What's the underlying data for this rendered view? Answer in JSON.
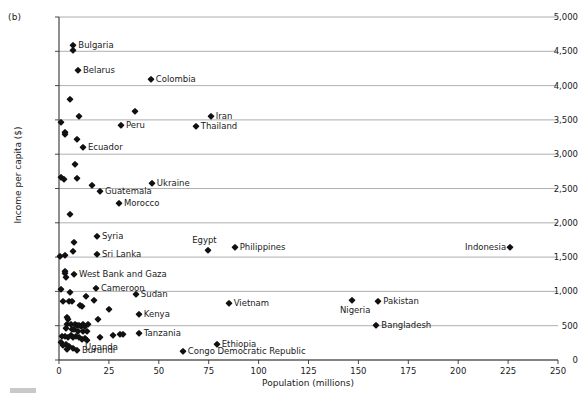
{
  "figure": {
    "panel_tag": "(b)",
    "caption_bar_color": "#c9c9c9"
  },
  "chart_data": {
    "type": "scatter",
    "title": "",
    "subtitle": "",
    "xlabel": "Population (millions)",
    "ylabel": "Income per capita ($)",
    "xlim": [
      0,
      250
    ],
    "ylim": [
      0,
      5000
    ],
    "xticks": [
      0,
      25,
      50,
      75,
      100,
      125,
      150,
      175,
      200,
      225,
      250
    ],
    "xtick_labels": [
      "0",
      "25",
      "50",
      "75",
      "100",
      "125",
      "150",
      "175",
      "200",
      "225",
      "250"
    ],
    "yticks": [
      0,
      500,
      1000,
      1500,
      2000,
      2500,
      3000,
      3500,
      4000,
      4500,
      5000
    ],
    "ytick_labels": [
      "0",
      "500",
      "1,000",
      "1,500",
      "2,000",
      "2,500",
      "3,000",
      "3,500",
      "4,000",
      "4,500",
      "5,000"
    ],
    "grid": "horizontal",
    "grid_color": "#9a9a9a",
    "axis_color": "#333333",
    "marker_color": "#111111",
    "marker_shape": "diamond",
    "legend": "none",
    "points": [
      {
        "label": "Bulgaria",
        "x": 7.2,
        "y": 4590,
        "label_pos": "right"
      },
      {
        "label": "",
        "x": 7.0,
        "y": 4520,
        "label_pos": "right"
      },
      {
        "label": "Belarus",
        "x": 9.5,
        "y": 4230,
        "label_pos": "right"
      },
      {
        "label": "Colombia",
        "x": 46.0,
        "y": 4090,
        "label_pos": "right"
      },
      {
        "label": "",
        "x": 5.5,
        "y": 3800,
        "label_pos": "right"
      },
      {
        "label": "",
        "x": 38.0,
        "y": 3625,
        "label_pos": "right"
      },
      {
        "label": "Iran",
        "x": 76.0,
        "y": 3550,
        "label_pos": "right"
      },
      {
        "label": "",
        "x": 10.0,
        "y": 3560,
        "label_pos": "right"
      },
      {
        "label": "",
        "x": 1.2,
        "y": 3470,
        "label_pos": "right"
      },
      {
        "label": "Peru",
        "x": 31.0,
        "y": 3420,
        "label_pos": "right"
      },
      {
        "label": "Thailand",
        "x": 68.5,
        "y": 3405,
        "label_pos": "right"
      },
      {
        "label": "",
        "x": 3.0,
        "y": 3325,
        "label_pos": "right"
      },
      {
        "label": "",
        "x": 2.8,
        "y": 3290,
        "label_pos": "right"
      },
      {
        "label": "",
        "x": 8.8,
        "y": 3215,
        "label_pos": "right"
      },
      {
        "label": "Ecuador",
        "x": 12.0,
        "y": 3110,
        "label_pos": "right"
      },
      {
        "label": "",
        "x": 7.8,
        "y": 2855,
        "label_pos": "right"
      },
      {
        "label": "",
        "x": 0.8,
        "y": 2665,
        "label_pos": "right"
      },
      {
        "label": "",
        "x": 2.4,
        "y": 2640,
        "label_pos": "right"
      },
      {
        "label": "",
        "x": 9.0,
        "y": 2650,
        "label_pos": "right"
      },
      {
        "label": "Ukraine",
        "x": 46.5,
        "y": 2575,
        "label_pos": "right"
      },
      {
        "label": "",
        "x": 16.5,
        "y": 2545,
        "label_pos": "right"
      },
      {
        "label": "Guatemala",
        "x": 20.5,
        "y": 2460,
        "label_pos": "right"
      },
      {
        "label": "Morocco",
        "x": 30.0,
        "y": 2295,
        "label_pos": "right"
      },
      {
        "label": "",
        "x": 5.3,
        "y": 2125,
        "label_pos": "right"
      },
      {
        "label": "Syria",
        "x": 19.0,
        "y": 1810,
        "label_pos": "right"
      },
      {
        "label": "",
        "x": 7.3,
        "y": 1725,
        "label_pos": "right"
      },
      {
        "label": "Egypt",
        "x": 74.5,
        "y": 1600,
        "label_pos": "above-left"
      },
      {
        "label": "Philippines",
        "x": 88.0,
        "y": 1650,
        "label_pos": "right"
      },
      {
        "label": "Indonesia",
        "x": 226.0,
        "y": 1650,
        "label_pos": "left"
      },
      {
        "label": "",
        "x": 6.8,
        "y": 1595,
        "label_pos": "right"
      },
      {
        "label": "Sri Lanka",
        "x": 19.0,
        "y": 1550,
        "label_pos": "right"
      },
      {
        "label": "",
        "x": 0.6,
        "y": 1510,
        "label_pos": "right"
      },
      {
        "label": "",
        "x": 3.2,
        "y": 1530,
        "label_pos": "right"
      },
      {
        "label": "",
        "x": 3.0,
        "y": 1300,
        "label_pos": "right"
      },
      {
        "label": "",
        "x": 3.1,
        "y": 1265,
        "label_pos": "right"
      },
      {
        "label": "West Bank and Gaza",
        "x": 7.5,
        "y": 1255,
        "label_pos": "right"
      },
      {
        "label": "",
        "x": 3.3,
        "y": 1215,
        "label_pos": "right"
      },
      {
        "label": "Cameroon",
        "x": 18.5,
        "y": 1055,
        "label_pos": "right"
      },
      {
        "label": "",
        "x": 0.9,
        "y": 1035,
        "label_pos": "right"
      },
      {
        "label": "",
        "x": 5.6,
        "y": 995,
        "label_pos": "right"
      },
      {
        "label": "Sudan",
        "x": 38.5,
        "y": 965,
        "label_pos": "right"
      },
      {
        "label": "",
        "x": 13.5,
        "y": 935,
        "label_pos": "right"
      },
      {
        "label": "",
        "x": 2.0,
        "y": 855,
        "label_pos": "right"
      },
      {
        "label": "",
        "x": 5.0,
        "y": 860,
        "label_pos": "right"
      },
      {
        "label": "",
        "x": 6.4,
        "y": 855,
        "label_pos": "right"
      },
      {
        "label": "",
        "x": 17.5,
        "y": 880,
        "label_pos": "right"
      },
      {
        "label": "Vietnam",
        "x": 85.0,
        "y": 835,
        "label_pos": "right"
      },
      {
        "label": "",
        "x": 10.5,
        "y": 805,
        "label_pos": "right"
      },
      {
        "label": "",
        "x": 11.5,
        "y": 790,
        "label_pos": "right"
      },
      {
        "label": "",
        "x": 25.0,
        "y": 740,
        "label_pos": "right"
      },
      {
        "label": "",
        "x": 4.2,
        "y": 630,
        "label_pos": "right"
      },
      {
        "label": "",
        "x": 4.3,
        "y": 600,
        "label_pos": "right"
      },
      {
        "label": "Kenya",
        "x": 40.0,
        "y": 670,
        "label_pos": "right"
      },
      {
        "label": "",
        "x": 19.5,
        "y": 595,
        "label_pos": "right"
      },
      {
        "label": "Nigeria",
        "x": 147.0,
        "y": 875,
        "label_pos": "below"
      },
      {
        "label": "Pakistan",
        "x": 160.0,
        "y": 855,
        "label_pos": "right"
      },
      {
        "label": "Bangladesh",
        "x": 159.0,
        "y": 505,
        "label_pos": "right"
      },
      {
        "label": "",
        "x": 4.0,
        "y": 530,
        "label_pos": "right"
      },
      {
        "label": "",
        "x": 5.8,
        "y": 520,
        "label_pos": "right"
      },
      {
        "label": "",
        "x": 8.2,
        "y": 530,
        "label_pos": "right"
      },
      {
        "label": "",
        "x": 9.0,
        "y": 505,
        "label_pos": "right"
      },
      {
        "label": "",
        "x": 10.0,
        "y": 515,
        "label_pos": "right"
      },
      {
        "label": "",
        "x": 11.0,
        "y": 500,
        "label_pos": "right"
      },
      {
        "label": "",
        "x": 12.0,
        "y": 520,
        "label_pos": "right"
      },
      {
        "label": "",
        "x": 13.0,
        "y": 495,
        "label_pos": "right"
      },
      {
        "label": "",
        "x": 14.5,
        "y": 530,
        "label_pos": "right"
      },
      {
        "label": "",
        "x": 3.5,
        "y": 470,
        "label_pos": "right"
      },
      {
        "label": "",
        "x": 6.5,
        "y": 450,
        "label_pos": "right"
      },
      {
        "label": "",
        "x": 7.5,
        "y": 455,
        "label_pos": "right"
      },
      {
        "label": "",
        "x": 9.5,
        "y": 430,
        "label_pos": "right"
      },
      {
        "label": "",
        "x": 11.8,
        "y": 430,
        "label_pos": "right"
      },
      {
        "label": "",
        "x": 14.0,
        "y": 425,
        "label_pos": "right"
      },
      {
        "label": "Tanzania",
        "x": 40.0,
        "y": 400,
        "label_pos": "right"
      },
      {
        "label": "",
        "x": 27.0,
        "y": 365,
        "label_pos": "right"
      },
      {
        "label": "",
        "x": 30.5,
        "y": 380,
        "label_pos": "right"
      },
      {
        "label": "",
        "x": 32.0,
        "y": 375,
        "label_pos": "right"
      },
      {
        "label": "Uganda",
        "x": 20.5,
        "y": 335,
        "label_pos": "below"
      },
      {
        "label": "",
        "x": 1.5,
        "y": 355,
        "label_pos": "right"
      },
      {
        "label": "",
        "x": 2.8,
        "y": 350,
        "label_pos": "right"
      },
      {
        "label": "",
        "x": 4.6,
        "y": 340,
        "label_pos": "right"
      },
      {
        "label": "",
        "x": 6.0,
        "y": 360,
        "label_pos": "right"
      },
      {
        "label": "",
        "x": 7.2,
        "y": 330,
        "label_pos": "right"
      },
      {
        "label": "",
        "x": 8.5,
        "y": 345,
        "label_pos": "right"
      },
      {
        "label": "",
        "x": 10.2,
        "y": 330,
        "label_pos": "right"
      },
      {
        "label": "",
        "x": 11.5,
        "y": 310,
        "label_pos": "right"
      },
      {
        "label": "",
        "x": 12.8,
        "y": 325,
        "label_pos": "right"
      },
      {
        "label": "",
        "x": 13.8,
        "y": 290,
        "label_pos": "right"
      },
      {
        "label": "Ethiopia",
        "x": 79.0,
        "y": 235,
        "label_pos": "right"
      },
      {
        "label": "",
        "x": 1.0,
        "y": 265,
        "label_pos": "right"
      },
      {
        "label": "",
        "x": 2.2,
        "y": 215,
        "label_pos": "right"
      },
      {
        "label": "",
        "x": 3.6,
        "y": 230,
        "label_pos": "right"
      },
      {
        "label": "",
        "x": 5.2,
        "y": 200,
        "label_pos": "right"
      },
      {
        "label": "",
        "x": 7.0,
        "y": 175,
        "label_pos": "right"
      },
      {
        "label": "Burundi",
        "x": 9.0,
        "y": 150,
        "label_pos": "right"
      },
      {
        "label": "",
        "x": 4.0,
        "y": 160,
        "label_pos": "right"
      },
      {
        "label": "Congo Democratic Republic",
        "x": 62.0,
        "y": 125,
        "label_pos": "right"
      }
    ]
  }
}
